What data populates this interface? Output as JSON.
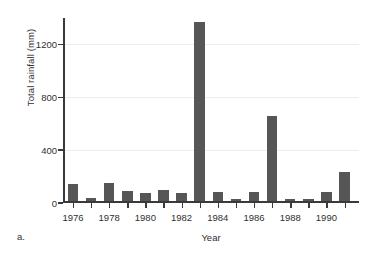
{
  "figure": {
    "caption": "a."
  },
  "chart_data": {
    "type": "bar",
    "title": "",
    "xlabel": "Year",
    "ylabel": "Total rainfall (mm)",
    "categories": [
      "1976",
      "1977",
      "1978",
      "1979",
      "1980",
      "1981",
      "1982",
      "1983",
      "1984",
      "1985",
      "1986",
      "1987",
      "1988",
      "1989",
      "1990",
      "1991"
    ],
    "values": [
      130,
      25,
      140,
      80,
      60,
      85,
      60,
      1355,
      75,
      20,
      75,
      645,
      15,
      20,
      70,
      225
    ],
    "ylim": [
      0,
      1400
    ],
    "xlim": [
      1975.4,
      1991.6
    ],
    "yticks": [
      0,
      400,
      800,
      1200
    ],
    "ytick_labels": [
      "0",
      "400",
      "800",
      "1200"
    ],
    "xticks": [
      "1976",
      "1977",
      "1978",
      "1979",
      "1980",
      "1981",
      "1982",
      "1983",
      "1984",
      "1985",
      "1986",
      "1987",
      "1988",
      "1989",
      "1990",
      "1991"
    ],
    "xtick_labels": [
      "1976",
      "1978",
      "1980",
      "1982",
      "1984",
      "1986",
      "1988",
      "1990"
    ],
    "grid": "horizontal",
    "legend": "none",
    "bar_color": "#565656",
    "gridline_color": "#ededed",
    "axis_color": "#3a3a3a"
  }
}
